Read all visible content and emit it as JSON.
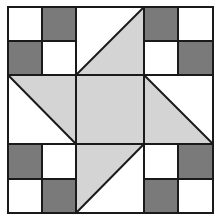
{
  "diagram": {
    "colors": {
      "background": "#ffffff",
      "dark": "#7a7a7a",
      "light": "#d4d4d4",
      "line": "#1a1a1a"
    },
    "grid": {
      "origin": [
        8,
        7
      ],
      "cell": 34.2,
      "size": 6
    },
    "center_square": {
      "fill": "light"
    },
    "corner_blocks": [
      {
        "position": "top-left",
        "dark_cells": [
          "top-right",
          "bottom-left"
        ]
      },
      {
        "position": "top-right",
        "dark_cells": [
          "top-left",
          "bottom-right"
        ]
      },
      {
        "position": "bottom-left",
        "dark_cells": [
          "top-left",
          "bottom-right"
        ]
      },
      {
        "position": "bottom-right",
        "dark_cells": [
          "top-right",
          "bottom-left"
        ]
      }
    ],
    "side_triangles": [
      {
        "position": "top",
        "fill": "light"
      },
      {
        "position": "right",
        "fill": "light"
      },
      {
        "position": "bottom",
        "fill": "light"
      },
      {
        "position": "left",
        "fill": "light"
      }
    ]
  }
}
